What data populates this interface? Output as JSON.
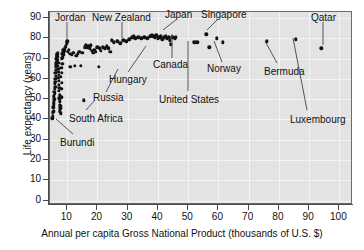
{
  "chart_data": {
    "type": "scatter",
    "title": "",
    "xlabel": "Annual per capita Gross National Product (thousands of U.S. $)",
    "ylabel": "Life expectancy (years)",
    "xlim": [
      4.3,
      104.5
    ],
    "ylim": [
      -2.2,
      93.0
    ],
    "xticks": [
      10,
      20,
      30,
      40,
      50,
      60,
      70,
      80,
      90,
      100
    ],
    "yticks": [
      0,
      10,
      20,
      30,
      40,
      50,
      60,
      70,
      80,
      90
    ],
    "grid": true,
    "legend": "none",
    "marker_color": "#121212",
    "plot_bg_color": "#e3e3e3",
    "points": [
      [
        5.0,
        40.5
      ],
      [
        5.2,
        41.8
      ],
      [
        5.3,
        43.5
      ],
      [
        5.5,
        44.0
      ],
      [
        5.4,
        46.0
      ],
      [
        5.6,
        47.5
      ],
      [
        5.5,
        48.5
      ],
      [
        5.7,
        50.0
      ],
      [
        5.6,
        51.5
      ],
      [
        5.8,
        52.5
      ],
      [
        5.7,
        53.5
      ],
      [
        5.9,
        55.0
      ],
      [
        6.0,
        56.0
      ],
      [
        5.8,
        57.5
      ],
      [
        6.1,
        58.5
      ],
      [
        6.0,
        60.0
      ],
      [
        6.2,
        61.5
      ],
      [
        6.1,
        63.0
      ],
      [
        6.3,
        64.5
      ],
      [
        6.2,
        66.0
      ],
      [
        6.4,
        67.0
      ],
      [
        6.3,
        68.0
      ],
      [
        6.5,
        69.0
      ],
      [
        6.4,
        70.0
      ],
      [
        6.6,
        70.8
      ],
      [
        6.5,
        71.5
      ],
      [
        6.7,
        72.0
      ],
      [
        6.6,
        72.5
      ],
      [
        6.8,
        73.0
      ],
      [
        6.7,
        71.0
      ],
      [
        6.9,
        69.5
      ],
      [
        7.0,
        68.0
      ],
      [
        6.8,
        66.5
      ],
      [
        7.1,
        65.0
      ],
      [
        7.0,
        63.5
      ],
      [
        7.2,
        62.0
      ],
      [
        7.1,
        60.5
      ],
      [
        7.3,
        59.0
      ],
      [
        7.2,
        57.0
      ],
      [
        7.4,
        55.5
      ],
      [
        7.3,
        54.0
      ],
      [
        7.5,
        52.0
      ],
      [
        7.4,
        50.5
      ],
      [
        7.6,
        49.0
      ],
      [
        7.5,
        47.0
      ],
      [
        7.7,
        45.5
      ],
      [
        7.6,
        44.0
      ],
      [
        7.8,
        43.0
      ],
      [
        7.9,
        46.5
      ],
      [
        8.0,
        51.0
      ],
      [
        8.1,
        55.0
      ],
      [
        8.2,
        58.0
      ],
      [
        7.9,
        61.0
      ],
      [
        8.3,
        63.0
      ],
      [
        8.0,
        65.5
      ],
      [
        8.4,
        67.5
      ],
      [
        8.2,
        70.0
      ],
      [
        8.5,
        71.5
      ],
      [
        8.3,
        72.5
      ],
      [
        8.6,
        73.5
      ],
      [
        8.7,
        74.5
      ],
      [
        8.4,
        70.5
      ],
      [
        8.8,
        72.0
      ],
      [
        8.9,
        73.0
      ],
      [
        9.0,
        74.0
      ],
      [
        9.2,
        75.0
      ],
      [
        9.5,
        76.0
      ],
      [
        9.8,
        77.5
      ],
      [
        10.0,
        78.5
      ],
      [
        10.2,
        73.5
      ],
      [
        10.5,
        74.5
      ],
      [
        10.8,
        72.5
      ],
      [
        11.0,
        66.0
      ],
      [
        11.5,
        72.0
      ],
      [
        12.0,
        73.0
      ],
      [
        12.5,
        66.5
      ],
      [
        13.0,
        71.5
      ],
      [
        13.5,
        72.5
      ],
      [
        14.0,
        73.5
      ],
      [
        14.5,
        66.5
      ],
      [
        15.0,
        73.0
      ],
      [
        15.4,
        49.5
      ],
      [
        15.8,
        75.5
      ],
      [
        16.2,
        76.5
      ],
      [
        16.6,
        75.5
      ],
      [
        17.0,
        76.0
      ],
      [
        17.4,
        75.0
      ],
      [
        17.8,
        76.5
      ],
      [
        18.2,
        74.0
      ],
      [
        18.6,
        73.0
      ],
      [
        19.0,
        74.5
      ],
      [
        19.5,
        73.5
      ],
      [
        20.0,
        75.5
      ],
      [
        20.4,
        66.0
      ],
      [
        20.8,
        75.0
      ],
      [
        21.2,
        74.0
      ],
      [
        21.8,
        75.5
      ],
      [
        22.4,
        75.0
      ],
      [
        23.0,
        76.0
      ],
      [
        23.6,
        75.0
      ],
      [
        24.2,
        73.5
      ],
      [
        24.8,
        79.0
      ],
      [
        25.5,
        78.0
      ],
      [
        26.5,
        78.5
      ],
      [
        27.5,
        77.5
      ],
      [
        28.5,
        79.0
      ],
      [
        29.5,
        78.5
      ],
      [
        30.5,
        79.5
      ],
      [
        31.5,
        80.5
      ],
      [
        32.0,
        81.0
      ],
      [
        32.5,
        80.0
      ],
      [
        33.5,
        80.5
      ],
      [
        34.5,
        80.0
      ],
      [
        35.5,
        80.5
      ],
      [
        36.5,
        80.0
      ],
      [
        37.5,
        81.0
      ],
      [
        38.0,
        81.5
      ],
      [
        38.5,
        81.0
      ],
      [
        39.0,
        80.5
      ],
      [
        39.5,
        81.5
      ],
      [
        40.0,
        80.0
      ],
      [
        40.5,
        80.5
      ],
      [
        41.0,
        81.0
      ],
      [
        41.5,
        79.5
      ],
      [
        42.0,
        80.5
      ],
      [
        42.5,
        81.0
      ],
      [
        43.0,
        80.0
      ],
      [
        43.5,
        80.5
      ],
      [
        44.0,
        79.0
      ],
      [
        44.3,
        77.0
      ],
      [
        44.8,
        80.5
      ],
      [
        45.5,
        80.0
      ],
      [
        46.0,
        80.5
      ],
      [
        52.0,
        78.0
      ],
      [
        53.0,
        78.0
      ],
      [
        56.0,
        82.0
      ],
      [
        57.0,
        75.5
      ],
      [
        59.5,
        80.0
      ],
      [
        61.5,
        78.0
      ],
      [
        76.0,
        78.5
      ],
      [
        85.5,
        79.5
      ],
      [
        94.0,
        75.0
      ]
    ],
    "annotations": [
      {
        "label": "Jordan",
        "label_x": 55,
        "label_y": 12,
        "lx1": 67,
        "ly1": 22,
        "lx2": 67,
        "ly2": 40
      },
      {
        "label": "New Zealand",
        "label_x": 92,
        "label_y": 12,
        "lx1": 122,
        "ly1": 22,
        "lx2": 122,
        "ly2": 38
      },
      {
        "label": "Japan",
        "label_x": 165,
        "label_y": 9,
        "lx1": 177,
        "ly1": 19,
        "lx2": 163,
        "ly2": 30
      },
      {
        "label": "Singapore",
        "label_x": 201,
        "label_y": 9,
        "lx1": 218,
        "ly1": 19,
        "lx2": 207,
        "ly2": 30
      },
      {
        "label": "Qatar",
        "label_x": 311,
        "label_y": 12,
        "lx1": 323,
        "ly1": 22,
        "lx2": 323,
        "ly2": 45
      },
      {
        "label": "Canada",
        "label_x": 153,
        "label_y": 59,
        "lx1": 172,
        "ly1": 58,
        "lx2": 172,
        "ly2": 34
      },
      {
        "label": "Norway",
        "label_x": 207,
        "label_y": 63,
        "lx1": 222,
        "ly1": 62,
        "lx2": 214,
        "ly2": 41
      },
      {
        "label": "Bermuda",
        "label_x": 264,
        "label_y": 66,
        "lx1": 277,
        "ly1": 63,
        "lx2": 265,
        "ly2": 41
      },
      {
        "label": "Luxembourg",
        "label_x": 290,
        "label_y": 114,
        "lx1": 307,
        "ly1": 110,
        "lx2": 293,
        "ly2": 38
      },
      {
        "label": "Hungary",
        "label_x": 109,
        "label_y": 74,
        "lx1": 128,
        "ly1": 72,
        "lx2": 146,
        "ly2": 46
      },
      {
        "label": "Russia",
        "label_x": 93,
        "label_y": 92,
        "lx1": 106,
        "ly1": 92,
        "lx2": 118,
        "ly2": 69
      },
      {
        "label": "United States",
        "label_x": 159,
        "label_y": 94,
        "lx1": 188,
        "ly1": 91,
        "lx2": 188,
        "ly2": 41
      },
      {
        "label": "South Africa",
        "label_x": 69,
        "label_y": 113,
        "lx1": 86,
        "ly1": 110,
        "lx2": 95,
        "ly2": 100
      },
      {
        "label": "Burundi",
        "label_x": 60,
        "label_y": 137,
        "lx1": 73,
        "ly1": 134,
        "lx2": 56,
        "ly2": 119
      }
    ]
  }
}
